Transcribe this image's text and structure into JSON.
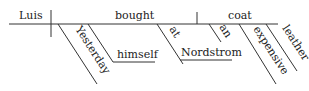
{
  "diagram": {
    "type": "sentence-diagram",
    "sentence": "Yesterday Luis bought himself an expensive leather coat at Nordstrom",
    "subject": "Luis",
    "verb": "bought",
    "direct_object": "coat",
    "modifiers": {
      "adverb": "Yesterday",
      "indirect_object": "himself",
      "preposition": "at",
      "prep_object": "Nordstrom",
      "article": "an",
      "adjective_1": "expensive",
      "adjective_2": "leather"
    },
    "colors": {
      "line": "#333333",
      "text": "#222222",
      "background": "#ffffff"
    }
  }
}
